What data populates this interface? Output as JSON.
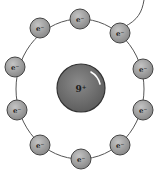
{
  "diagram": {
    "nucleus": {
      "label": "9⁺",
      "cx": 81,
      "cy": 88,
      "r": 24,
      "color": "#6e6e6e"
    },
    "orbit": {
      "cx": 80,
      "cy": 89,
      "rx": 64,
      "ry": 70,
      "stroke": "#555555"
    },
    "electron_color": "#9a9a9a",
    "electron_radius": 10,
    "electrons": [
      {
        "label": "e⁻",
        "x": 80,
        "y": 19
      },
      {
        "label": "e⁻",
        "x": 120,
        "y": 33
      },
      {
        "label": "e⁻",
        "x": 143,
        "y": 69
      },
      {
        "label": "e⁻",
        "x": 143,
        "y": 110
      },
      {
        "label": "e⁻",
        "x": 120,
        "y": 145
      },
      {
        "label": "e⁻",
        "x": 81,
        "y": 159
      },
      {
        "label": "e⁻",
        "x": 40,
        "y": 145
      },
      {
        "label": "e⁻",
        "x": 17,
        "y": 110
      },
      {
        "label": "e⁻",
        "x": 15,
        "y": 67
      },
      {
        "label": "e⁻",
        "x": 40,
        "y": 28
      }
    ]
  }
}
